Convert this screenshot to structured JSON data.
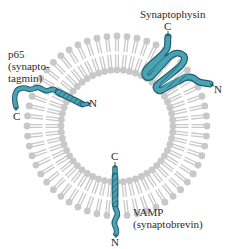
{
  "diagram": {
    "colors": {
      "protein_fill": "#4aa3b5",
      "protein_stroke": "#1f5f6e",
      "lipid": "#c8c8c8",
      "text": "#2a2a2a",
      "background": "#ffffff"
    },
    "membrane": {
      "type": "lipid-bilayer-vesicle",
      "center": [
        117,
        126
      ],
      "outer_radius": 94,
      "inner_radius": 52
    },
    "proteins": [
      {
        "id": "p65",
        "label_lines": [
          "p65",
          "(synapto-",
          "tagmin)"
        ],
        "c_terminus": "C",
        "n_terminus": "N",
        "position": "upper-left"
      },
      {
        "id": "synaptophysin",
        "label_lines": [
          "Synaptophysin"
        ],
        "c_terminus": "C",
        "n_terminus": "N",
        "position": "upper-right"
      },
      {
        "id": "vamp",
        "label_lines": [
          "VAMP",
          "(synaptobrevin)"
        ],
        "c_terminus": "C",
        "n_terminus": "N",
        "position": "bottom"
      }
    ]
  }
}
